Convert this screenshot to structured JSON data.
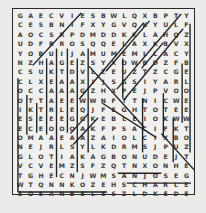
{
  "puzzle": {
    "cols": 17,
    "rows": 19,
    "grid": [
      "GAECVIESBWLQXBPTZPMY",
      "CESBNIFXYGVQKYULLLF",
      "AOCSRPDMDDKKLAAHQZ",
      "UDFRROSQQELAXKBYVX",
      "YOBUIJAMUMEMLLACYT",
      "NZHAGEZSYXOWWBBDZFB",
      "CSUKTDVLAZEUZTEZCG",
      "CLXEAAXIHJSGSIYAR",
      "OCCAAAAGZHXXPEJPVO",
      "OTTAEEWWNFTTNICWE",
      "ILKTRLEQJFEGHTOE",
      "EESEEEGIKEBLEOIKW",
      "EOCEOOOARFSACIFKT",
      "GOMAAEAAAIOLCIDXBO",
      "NEJRLSYLKDRMSJPUZE",
      "GLOTIAIKAGBONUDEJT",
      "VCVEMZSFZQTNXONHUGE",
      "TGHECNJJWMSANJOSEYG",
      "WTQNNKOZEHSCHARLOTTE"
    ],
    "grid_display": [
      [
        "G",
        "A",
        "E",
        "C",
        "V",
        "I",
        "E",
        "S",
        "B",
        "W",
        "L",
        "Q",
        "X",
        "B",
        "P",
        "T",
        "Z",
        "P",
        "M",
        "Y"
      ],
      [
        "C",
        "E",
        "S",
        "B",
        "N",
        "I",
        "F",
        "X",
        "Y",
        "G",
        "V",
        "Q",
        "K",
        "Y",
        "U",
        "L",
        "L",
        "F"
      ],
      [
        "A",
        "O",
        "C",
        "S",
        "R",
        "P",
        "D",
        "M",
        "D",
        "D",
        "K",
        "K",
        "L",
        "A",
        "A",
        "H",
        "Q",
        "Z"
      ]
    ],
    "rows_text": [
      [
        "G",
        "A",
        "E",
        "C",
        "V",
        "I",
        "E",
        "S",
        "B",
        "W",
        "L",
        "Q",
        "X",
        "B",
        "P",
        "T",
        "P",
        "M",
        "Y"
      ],
      [
        "C",
        "E",
        "S",
        "B",
        "N",
        "I",
        "F",
        "X",
        "Y",
        "G",
        "V",
        "Q",
        "K",
        "Y",
        "U",
        "L",
        "L",
        "F"
      ],
      [
        "A",
        "O",
        "C",
        "S",
        "R",
        "P",
        "D",
        "M",
        "D",
        "D",
        "K",
        "K",
        "L",
        "A",
        "A",
        "H",
        "Q",
        "Z"
      ],
      [
        "U",
        "D",
        "F",
        "R",
        "R",
        "O",
        "S",
        "Q",
        "Q",
        "E",
        "L",
        "A",
        "X",
        "K",
        "B",
        "Y",
        "V",
        "X"
      ],
      [
        "Y",
        "O",
        "B",
        "U",
        "I",
        "J",
        "A",
        "M",
        "U",
        "M",
        "E",
        "M",
        "L",
        "L",
        "A",
        "C",
        "Y",
        "T"
      ],
      [
        "N",
        "Z",
        "H",
        "A",
        "G",
        "E",
        "Z",
        "S",
        "Y",
        "X",
        "O",
        "W",
        "W",
        "B",
        "D",
        "Z",
        "F",
        "B"
      ],
      [
        "C",
        "S",
        "U",
        "K",
        "T",
        "D",
        "V",
        "L",
        "A",
        "Z",
        "E",
        "U",
        "Z",
        "T",
        "Z",
        "C",
        "G",
        "E"
      ],
      [
        "C",
        "L",
        "X",
        "E",
        "A",
        "A",
        "X",
        "I",
        "H",
        "J",
        "S",
        "G",
        "S",
        "I",
        "Y",
        "A",
        "R",
        "L"
      ],
      [
        "O",
        "C",
        "C",
        "A",
        "A",
        "A",
        "G",
        "Z",
        "H",
        "X",
        "X",
        "P",
        "E",
        "J",
        "P",
        "V",
        "O",
        "O"
      ],
      [
        "O",
        "T",
        "T",
        "A",
        "E",
        "E",
        "W",
        "W",
        "N",
        "F",
        "T",
        "T",
        "N",
        "I",
        "C",
        "W",
        "E",
        "E"
      ],
      [
        "I",
        "K",
        "T",
        "R",
        "L",
        "E",
        "Q",
        "J",
        "F",
        "E",
        "G",
        "H",
        "T",
        "O",
        "E",
        "E",
        "E",
        "E"
      ],
      [
        "E",
        "S",
        "E",
        "E",
        "E",
        "G",
        "G",
        "I",
        "K",
        "E",
        "B",
        "L",
        "E",
        "I",
        "O",
        "K",
        "W",
        "W"
      ],
      [
        "E",
        "C",
        "E",
        "O",
        "O",
        "O",
        "A",
        "R",
        "F",
        "S",
        "A",
        "C",
        "I",
        "F",
        "K",
        "T",
        "T",
        "T"
      ],
      [
        "O",
        "M",
        "A",
        "A",
        "E",
        "A",
        "A",
        "A",
        "I",
        "O",
        "L",
        "C",
        "I",
        "D",
        "X",
        "B",
        "O",
        "O"
      ],
      [
        "N",
        "E",
        "J",
        "R",
        "L",
        "S",
        "Y",
        "L",
        "K",
        "D",
        "R",
        "M",
        "S",
        "J",
        "P",
        "U",
        "Z",
        "E"
      ],
      [
        "G",
        "L",
        "O",
        "T",
        "I",
        "A",
        "K",
        "A",
        "G",
        "B",
        "O",
        "N",
        "U",
        "D",
        "E",
        "J",
        "T",
        "T"
      ],
      [
        "V",
        "C",
        "V",
        "E",
        "M",
        "Z",
        "S",
        "F",
        "Z",
        "Q",
        "T",
        "N",
        "X",
        "O",
        "N",
        "H",
        "U",
        "G",
        "E"
      ],
      [
        "T",
        "G",
        "H",
        "E",
        "C",
        "N",
        "J",
        "J",
        "W",
        "M",
        "S",
        "A",
        "N",
        "J",
        "O",
        "S",
        "E",
        "Y",
        "G"
      ],
      [
        "W",
        "T",
        "Q",
        "N",
        "N",
        "K",
        "O",
        "Z",
        "E",
        "H",
        "S",
        "C",
        "H",
        "A",
        "R",
        "L",
        "O",
        "T",
        "T",
        "E"
      ],
      [
        "S",
        "O",
        "S",
        "A",
        "N",
        "B",
        "E",
        "L",
        "E",
        "S",
        "Z",
        "L",
        "D",
        "K",
        "E",
        "D",
        "M",
        "R",
        "F",
        "E"
      ]
    ]
  },
  "grid17": [
    [
      "G",
      "A",
      "E",
      "C",
      "V",
      "I",
      "E",
      "S",
      "B",
      "W",
      "L",
      "Q",
      "X",
      "B",
      "P",
      "T",
      "Y"
    ],
    [
      "C",
      "E",
      "S",
      "B",
      "N",
      "I",
      "F",
      "X",
      "Y",
      "G",
      "V",
      "Q",
      "K",
      "Y",
      "U",
      "L",
      "F"
    ],
    [
      "A",
      "O",
      "C",
      "S",
      "R",
      "P",
      "D",
      "M",
      "D",
      "D",
      "K",
      "K",
      "L",
      "A",
      "H",
      "Q",
      "Z"
    ],
    [
      "U",
      "D",
      "F",
      "R",
      "R",
      "O",
      "S",
      "Q",
      "Q",
      "E",
      "L",
      "A",
      "X",
      "K",
      "B",
      "V",
      "X"
    ],
    [
      "Y",
      "O",
      "B",
      "U",
      "I",
      "J",
      "A",
      "M",
      "U",
      "M",
      "E",
      "M",
      "L",
      "L",
      "A",
      "C",
      "Y"
    ],
    [
      "N",
      "Z",
      "H",
      "A",
      "G",
      "E",
      "Z",
      "S",
      "Y",
      "X",
      "O",
      "W",
      "B",
      "D",
      "Z",
      "F",
      "B"
    ],
    [
      "C",
      "S",
      "U",
      "K",
      "T",
      "D",
      "V",
      "L",
      "Z",
      "E",
      "U",
      "Z",
      "T",
      "Z",
      "C",
      "G",
      "E"
    ],
    [
      "C",
      "L",
      "X",
      "E",
      "A",
      "A",
      "X",
      "I",
      "J",
      "S",
      "G",
      "S",
      "I",
      "Y",
      "A",
      "R",
      "L"
    ],
    [
      "O",
      "C",
      "C",
      "A",
      "A",
      "A",
      "G",
      "Z",
      "H",
      "X",
      "P",
      "E",
      "J",
      "P",
      "V",
      "O",
      "O"
    ],
    [
      "O",
      "T",
      "T",
      "A",
      "E",
      "E",
      "W",
      "W",
      "N",
      "F",
      "T",
      "T",
      "N",
      "I",
      "C",
      "W",
      "E"
    ],
    [
      "I",
      "K",
      "T",
      "R",
      "L",
      "E",
      "Q",
      "J",
      "F",
      "E",
      "G",
      "H",
      "T",
      "O",
      "T",
      "E",
      "E"
    ],
    [
      "E",
      "S",
      "E",
      "E",
      "E",
      "G",
      "G",
      "K",
      "E",
      "B",
      "L",
      "E",
      "I",
      "O",
      "K",
      "W",
      "W"
    ],
    [
      "E",
      "C",
      "E",
      "O",
      "O",
      "O",
      "A",
      "K",
      "F",
      "P",
      "S",
      "A",
      "C",
      "I",
      "F",
      "K",
      "T"
    ],
    [
      "O",
      "M",
      "A",
      "A",
      "E",
      "A",
      "A",
      "Z",
      "A",
      "I",
      "O",
      "L",
      "C",
      "I",
      "X",
      "B",
      "O"
    ],
    [
      "N",
      "E",
      "J",
      "R",
      "L",
      "S",
      "Y",
      "L",
      "K",
      "D",
      "R",
      "M",
      "S",
      "J",
      "P",
      "U",
      "Z"
    ],
    [
      "G",
      "L",
      "O",
      "T",
      "I",
      "A",
      "K",
      "A",
      "G",
      "B",
      "O",
      "N",
      "U",
      "D",
      "E",
      "J",
      "T"
    ],
    [
      "V",
      "C",
      "V",
      "E",
      "M",
      "Z",
      "S",
      "F",
      "Z",
      "Q",
      "T",
      "N",
      "X",
      "O",
      "N",
      "H",
      "E"
    ],
    [
      "T",
      "G",
      "H",
      "E",
      "C",
      "N",
      "J",
      "W",
      "M",
      "S",
      "A",
      "N",
      "J",
      "O",
      "S",
      "E",
      "G"
    ],
    [
      "W",
      "T",
      "Q",
      "N",
      "N",
      "K",
      "O",
      "Z",
      "E",
      "H",
      "S",
      "C",
      "H",
      "A",
      "R",
      "L",
      "E"
    ],
    [
      "S",
      "O",
      "S",
      "A",
      "N",
      "B",
      "E",
      "L",
      "E",
      "S",
      "Z",
      "L",
      "D",
      "K",
      "E",
      "D",
      "E"
    ]
  ],
  "found_words_visible": [
    "SAN JOSE",
    "CHARLOTTE",
    "LOS ANGELES"
  ],
  "colors": {
    "background": "#ebebea",
    "paper": "#f0f0ef",
    "ink": "#3a3a3a",
    "line": "#222222"
  }
}
